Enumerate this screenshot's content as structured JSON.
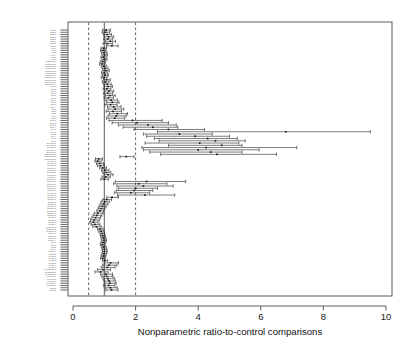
{
  "figure": {
    "kind": "forest-plot",
    "background": "#ffffff",
    "frame_color": "#4a4a4a"
  },
  "axis_title": "Nonparametric ratio-to-control comparisons",
  "chart_data": {
    "type": "scatter",
    "subtype": "forest-plot-confidence-intervals",
    "title": "",
    "subtitle": "",
    "xlabel": "Nonparametric ratio-to-control comparisons",
    "ylabel": "",
    "xlim": [
      0,
      10.4
    ],
    "xticks": [
      0,
      2,
      4,
      6,
      8,
      10
    ],
    "xticklabels": [
      "0",
      "2",
      "4",
      "6",
      "8",
      "10"
    ],
    "grid": false,
    "legend": null,
    "legend_position": "none",
    "reference_lines": [
      {
        "value": 1.0,
        "style": "solid",
        "color": "#3a3a3a"
      },
      {
        "value": 0.5,
        "style": "dashed",
        "color": "#3a3a3a"
      },
      {
        "value": 2.0,
        "style": "dashed",
        "color": "#3a3a3a"
      }
    ],
    "point_marker": "square",
    "error_bar_cap": true,
    "n_rows": 113,
    "ylabels": [
      "SUB.1",
      "SUB.2",
      "SUB.3",
      "SUB.4",
      "SUB.5",
      "SUB.6",
      "SUB.7",
      "SUB.8",
      "ALN.1",
      "ALN.2",
      "ALN.3",
      "ALN.4",
      "ALN.5",
      "ALN.6",
      "Sorafenib.1",
      "Sorafenib.2",
      "Sorafenib.3",
      "Amsacrine.1",
      "Amsacrine.2",
      "Amsacrine.3",
      "Amsacrine.4",
      "Oxaliplatin.1",
      "Oxaliplatin.2",
      "Oxaliplatin.3",
      "Oxaliplatin.4",
      "ACR.1",
      "ACR.2",
      "ACR.3",
      "ACR.4",
      "ACR.5",
      "ACR.6",
      "ADR.1",
      "ADR.2",
      "ADR.3",
      "ADR.4",
      "AZT.1",
      "AZT.2",
      "AZT.3",
      "AZT.4",
      "AZT.5",
      "BLM.1",
      "BLM.2",
      "BLM.3",
      "BLM.4",
      "Nov.1",
      "Nov.2",
      "Nov.3",
      "Nov.4",
      "Nov.5",
      "Nov.6",
      "Dioxane.1",
      "Dioxane.2",
      "Dioxane.3",
      "Dioxane.4",
      "Dioxane.5",
      "Dibromide.1",
      "Dibromide.2",
      "Dibromide.3",
      "Styrene.1",
      "Styrene.2",
      "Styrene.3",
      "Styrene.4",
      "Toluene.1",
      "Toluene.2",
      "Toluene.3",
      "Toluene.4",
      "Chloride.1",
      "Chloride.2",
      "Chloride.3",
      "Chloride.4",
      "Chloride.5",
      "Sodium.1",
      "Sodium.2",
      "Sodium.3",
      "Sodium.4",
      "Butane.1",
      "Butane.2",
      "Butane.3",
      "Ethanol.1",
      "Ethanol.2",
      "Ethanol.3",
      "Ethanol.4",
      "Ethanol.5",
      "Diesel.1",
      "Diesel.2",
      "Diesel.3",
      "Diesel.4",
      "Dimethyl.1",
      "Dimethyl.2",
      "Dimethyl.3",
      "Phenol.1",
      "Phenol.2",
      "Phenol.3",
      "Phenol.4",
      "Cad.1",
      "Cad.2",
      "Cad.3",
      "Cad.4",
      "Nickel.1",
      "Nickel.2",
      "Nickel.3",
      "PHOR.1",
      "PHOR.2",
      "PHOR.3",
      "PHOR.4",
      "PHOR.5",
      "Potassium.1",
      "Potassium.2",
      "Potassium.3",
      "Formate.1",
      "Formate.2",
      "Formate.3",
      "Formate.4",
      "Formate.5"
    ],
    "rows": [
      {
        "estimate": 1.06,
        "low": 0.95,
        "high": 1.2
      },
      {
        "estimate": 1.04,
        "low": 0.93,
        "high": 1.17
      },
      {
        "estimate": 1.09,
        "low": 0.97,
        "high": 1.23
      },
      {
        "estimate": 1.14,
        "low": 1.0,
        "high": 1.3
      },
      {
        "estimate": 1.11,
        "low": 0.98,
        "high": 1.26
      },
      {
        "estimate": 1.19,
        "low": 1.04,
        "high": 1.36
      },
      {
        "estimate": 1.1,
        "low": 0.96,
        "high": 1.26
      },
      {
        "estimate": 1.24,
        "low": 1.07,
        "high": 1.44
      },
      {
        "estimate": 0.98,
        "low": 0.9,
        "high": 1.07
      },
      {
        "estimate": 0.96,
        "low": 0.88,
        "high": 1.05
      },
      {
        "estimate": 0.99,
        "low": 0.91,
        "high": 1.08
      },
      {
        "estimate": 1.01,
        "low": 0.93,
        "high": 1.1
      },
      {
        "estimate": 0.97,
        "low": 0.89,
        "high": 1.06
      },
      {
        "estimate": 1.0,
        "low": 0.92,
        "high": 1.09
      },
      {
        "estimate": 0.95,
        "low": 0.87,
        "high": 1.04
      },
      {
        "estimate": 0.93,
        "low": 0.85,
        "high": 1.02
      },
      {
        "estimate": 0.98,
        "low": 0.9,
        "high": 1.07
      },
      {
        "estimate": 1.02,
        "low": 0.93,
        "high": 1.12
      },
      {
        "estimate": 1.05,
        "low": 0.95,
        "high": 1.16
      },
      {
        "estimate": 1.0,
        "low": 0.91,
        "high": 1.1
      },
      {
        "estimate": 1.03,
        "low": 0.94,
        "high": 1.13
      },
      {
        "estimate": 0.99,
        "low": 0.9,
        "high": 1.09
      },
      {
        "estimate": 1.07,
        "low": 0.96,
        "high": 1.19
      },
      {
        "estimate": 1.04,
        "low": 0.94,
        "high": 1.15
      },
      {
        "estimate": 1.09,
        "low": 0.98,
        "high": 1.22
      },
      {
        "estimate": 1.12,
        "low": 1.0,
        "high": 1.26
      },
      {
        "estimate": 1.08,
        "low": 0.96,
        "high": 1.21
      },
      {
        "estimate": 1.15,
        "low": 1.02,
        "high": 1.3
      },
      {
        "estimate": 1.11,
        "low": 0.98,
        "high": 1.26
      },
      {
        "estimate": 1.18,
        "low": 1.03,
        "high": 1.35
      },
      {
        "estimate": 1.13,
        "low": 0.99,
        "high": 1.29
      },
      {
        "estimate": 1.22,
        "low": 1.05,
        "high": 1.42
      },
      {
        "estimate": 1.26,
        "low": 1.08,
        "high": 1.47
      },
      {
        "estimate": 1.2,
        "low": 1.02,
        "high": 1.41
      },
      {
        "estimate": 1.3,
        "low": 1.1,
        "high": 1.54
      },
      {
        "estimate": 1.35,
        "low": 1.12,
        "high": 1.62
      },
      {
        "estimate": 1.28,
        "low": 1.06,
        "high": 1.55
      },
      {
        "estimate": 1.42,
        "low": 1.16,
        "high": 1.74
      },
      {
        "estimate": 1.38,
        "low": 1.12,
        "high": 1.7
      },
      {
        "estimate": 1.33,
        "low": 1.07,
        "high": 1.65
      },
      {
        "estimate": 1.9,
        "low": 1.15,
        "high": 2.85
      },
      {
        "estimate": 2.05,
        "low": 1.25,
        "high": 3.05
      },
      {
        "estimate": 2.4,
        "low": 1.45,
        "high": 3.3
      },
      {
        "estimate": 2.55,
        "low": 1.6,
        "high": 3.35
      },
      {
        "estimate": 3.05,
        "low": 1.95,
        "high": 4.2
      },
      {
        "estimate": 6.8,
        "low": 2.7,
        "high": 9.5
      },
      {
        "estimate": 3.4,
        "low": 2.25,
        "high": 4.45
      },
      {
        "estimate": 3.9,
        "low": 2.35,
        "high": 5.0
      },
      {
        "estimate": 4.3,
        "low": 2.6,
        "high": 5.25
      },
      {
        "estimate": 4.55,
        "low": 2.75,
        "high": 5.5
      },
      {
        "estimate": 4.05,
        "low": 2.3,
        "high": 5.3
      },
      {
        "estimate": 4.75,
        "low": 3.05,
        "high": 5.4
      },
      {
        "estimate": 4.25,
        "low": 2.2,
        "high": 7.15
      },
      {
        "estimate": 4.0,
        "low": 2.25,
        "high": 5.95
      },
      {
        "estimate": 4.4,
        "low": 2.45,
        "high": 5.4
      },
      {
        "estimate": 4.6,
        "low": 2.8,
        "high": 6.5
      },
      {
        "estimate": 1.7,
        "low": 1.5,
        "high": 1.95
      },
      {
        "estimate": 0.82,
        "low": 0.72,
        "high": 0.94
      },
      {
        "estimate": 0.79,
        "low": 0.7,
        "high": 0.9
      },
      {
        "estimate": 0.85,
        "low": 0.75,
        "high": 0.97
      },
      {
        "estimate": 0.88,
        "low": 0.78,
        "high": 1.0
      },
      {
        "estimate": 0.95,
        "low": 0.85,
        "high": 1.07
      },
      {
        "estimate": 1.02,
        "low": 0.91,
        "high": 1.15
      },
      {
        "estimate": 1.07,
        "low": 0.95,
        "high": 1.21
      },
      {
        "estimate": 1.12,
        "low": 0.99,
        "high": 1.28
      },
      {
        "estimate": 1.05,
        "low": 0.93,
        "high": 1.19
      },
      {
        "estimate": 1.0,
        "low": 0.89,
        "high": 1.13
      },
      {
        "estimate": 2.35,
        "low": 1.35,
        "high": 3.6
      },
      {
        "estimate": 2.1,
        "low": 1.3,
        "high": 3.0
      },
      {
        "estimate": 2.25,
        "low": 1.4,
        "high": 3.2
      },
      {
        "estimate": 2.0,
        "low": 1.45,
        "high": 2.7
      },
      {
        "estimate": 1.95,
        "low": 1.38,
        "high": 2.55
      },
      {
        "estimate": 1.85,
        "low": 1.32,
        "high": 2.45
      },
      {
        "estimate": 2.3,
        "low": 1.42,
        "high": 3.25
      },
      {
        "estimate": 1.25,
        "low": 1.08,
        "high": 1.45
      },
      {
        "estimate": 1.08,
        "low": 0.95,
        "high": 1.23
      },
      {
        "estimate": 1.02,
        "low": 0.9,
        "high": 1.16
      },
      {
        "estimate": 0.98,
        "low": 0.87,
        "high": 1.11
      },
      {
        "estimate": 0.94,
        "low": 0.83,
        "high": 1.06
      },
      {
        "estimate": 0.9,
        "low": 0.8,
        "high": 1.02
      },
      {
        "estimate": 0.86,
        "low": 0.76,
        "high": 0.97
      },
      {
        "estimate": 0.8,
        "low": 0.68,
        "high": 0.96
      },
      {
        "estimate": 0.76,
        "low": 0.64,
        "high": 0.92
      },
      {
        "estimate": 0.72,
        "low": 0.6,
        "high": 0.88
      },
      {
        "estimate": 0.68,
        "low": 0.56,
        "high": 0.84
      },
      {
        "estimate": 0.65,
        "low": 0.54,
        "high": 0.8
      },
      {
        "estimate": 0.7,
        "low": 0.58,
        "high": 0.86
      },
      {
        "estimate": 0.75,
        "low": 0.63,
        "high": 0.9
      },
      {
        "estimate": 0.86,
        "low": 0.78,
        "high": 0.96
      },
      {
        "estimate": 0.9,
        "low": 0.82,
        "high": 0.99
      },
      {
        "estimate": 0.93,
        "low": 0.86,
        "high": 1.01
      },
      {
        "estimate": 0.95,
        "low": 0.88,
        "high": 1.03
      },
      {
        "estimate": 0.97,
        "low": 0.9,
        "high": 1.05
      },
      {
        "estimate": 0.99,
        "low": 0.92,
        "high": 1.07
      },
      {
        "estimate": 0.96,
        "low": 0.89,
        "high": 1.04
      },
      {
        "estimate": 0.94,
        "low": 0.87,
        "high": 1.02
      },
      {
        "estimate": 0.98,
        "low": 0.91,
        "high": 1.06
      },
      {
        "estimate": 1.0,
        "low": 0.93,
        "high": 1.08
      },
      {
        "estimate": 1.01,
        "low": 0.94,
        "high": 1.09
      },
      {
        "estimate": 0.99,
        "low": 0.92,
        "high": 1.07
      },
      {
        "estimate": 0.97,
        "low": 0.9,
        "high": 1.05
      },
      {
        "estimate": 0.95,
        "low": 0.88,
        "high": 1.03
      },
      {
        "estimate": 1.02,
        "low": 0.94,
        "high": 1.11
      },
      {
        "estimate": 1.2,
        "low": 1.0,
        "high": 1.45
      },
      {
        "estimate": 1.15,
        "low": 0.95,
        "high": 1.4
      },
      {
        "estimate": 1.1,
        "low": 0.9,
        "high": 1.34
      },
      {
        "estimate": 0.96,
        "low": 0.78,
        "high": 1.2
      },
      {
        "estimate": 0.88,
        "low": 0.7,
        "high": 1.12
      },
      {
        "estimate": 1.05,
        "low": 0.88,
        "high": 1.26
      },
      {
        "estimate": 1.08,
        "low": 0.92,
        "high": 1.28
      },
      {
        "estimate": 1.12,
        "low": 0.96,
        "high": 1.32
      },
      {
        "estimate": 1.15,
        "low": 0.99,
        "high": 1.35
      },
      {
        "estimate": 1.18,
        "low": 1.02,
        "high": 1.38
      },
      {
        "estimate": 1.14,
        "low": 0.98,
        "high": 1.34
      },
      {
        "estimate": 1.2,
        "low": 1.03,
        "high": 1.41
      },
      {
        "estimate": 1.23,
        "low": 1.05,
        "high": 1.44
      }
    ]
  },
  "geometry": {
    "plot_left": 68,
    "plot_right": 392,
    "plot_top": 22,
    "plot_bottom": 296,
    "x_zero_px": 73,
    "x_ten_px": 386,
    "row_top_px": 30,
    "row_bottom_px": 290,
    "ylabel_right_px": 56,
    "axis_title_y_px": 335
  }
}
